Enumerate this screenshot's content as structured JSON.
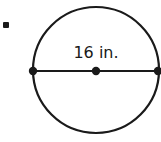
{
  "problem": {
    "number_suffix": "."
  },
  "diagram": {
    "shape": "circle",
    "measurement_label": "16 in.",
    "measured_segment": "diameter",
    "points": [
      "left-endpoint",
      "center",
      "right-endpoint"
    ],
    "stroke_color": "#1a1a1a",
    "background_color": "#ffffff"
  }
}
